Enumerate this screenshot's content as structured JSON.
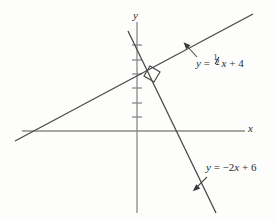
{
  "figure": {
    "background_color": "#fdfdfb",
    "line_color": "#4a4a4a",
    "axis_color": "#8a8a8a",
    "text_color": "#2b2b2b"
  },
  "axes": {
    "x_label": "x",
    "y_label": "y",
    "x_axis": {
      "x1": 22,
      "y1": 131,
      "x2": 245,
      "y2": 131
    },
    "y_axis": {
      "x1": 137,
      "y1": 22,
      "x2": 137,
      "y2": 213
    },
    "origin": {
      "x": 137,
      "y": 131
    },
    "unit_px": 14.3,
    "y_ticks": [
      1,
      2,
      3,
      4,
      5,
      6
    ],
    "tick_half_width": 5
  },
  "lines": [
    {
      "id": "line-1",
      "label_plain": "y = 1/2 x + 4",
      "label_lhs": "y",
      "label_eq": "= ",
      "label_num": "1",
      "label_den": "2",
      "label_x": "x",
      "label_tail": "+ 4",
      "slope": 0.5,
      "intercept": 4,
      "endpoints": {
        "x1": 15,
        "y1": 141,
        "x2": 253,
        "y2": 14
      },
      "label_pos": {
        "x": 196,
        "y": 59
      },
      "arrow": {
        "x1": 196,
        "y1": 58,
        "x2": 185,
        "y2": 45
      }
    },
    {
      "id": "line-2",
      "label_plain": "y = -2x + 6",
      "label_lhs": "y",
      "label_eq": "= ",
      "label_num": "",
      "label_den": "",
      "label_x": "-2x",
      "label_tail": "+ 6",
      "slope": -2,
      "intercept": 6,
      "endpoints": {
        "x1": 128,
        "y1": 31,
        "x2": 216,
        "y2": 213
      },
      "label_pos": {
        "x": 206,
        "y": 165
      },
      "arrow": {
        "x1": 206,
        "y1": 178,
        "x2": 194,
        "y2": 190
      }
    }
  ],
  "right_angle_marker": {
    "present": true,
    "description": "small square indicating perpendicular intersection",
    "points": "150,66 160,72 154,82 144,76"
  }
}
